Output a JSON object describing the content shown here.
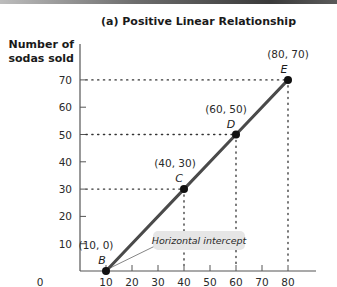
{
  "chart_data": {
    "type": "line",
    "title": "(a) Positive Linear Relationship",
    "xlabel": "",
    "ylabel": "Number of sodas sold",
    "ylabel_lines": [
      "Number of",
      "sodas sold"
    ],
    "x_ticks": [
      0,
      10,
      20,
      30,
      40,
      50,
      60,
      70,
      80
    ],
    "y_ticks": [
      10,
      20,
      30,
      40,
      50,
      60,
      70
    ],
    "xlim": [
      0,
      88
    ],
    "ylim": [
      0,
      75
    ],
    "grid": false,
    "series": [
      {
        "name": "Positive linear relationship",
        "x": [
          10,
          40,
          60,
          80
        ],
        "y": [
          0,
          30,
          50,
          70
        ],
        "color": "#4a4a4a"
      }
    ],
    "points": [
      {
        "letter": "B",
        "label": "(10, 0)",
        "x": 10,
        "y": 0
      },
      {
        "letter": "C",
        "label": "(40, 30)",
        "x": 40,
        "y": 30
      },
      {
        "letter": "D",
        "label": "(60, 50)",
        "x": 60,
        "y": 50
      },
      {
        "letter": "E",
        "label": "(80, 70)",
        "x": 80,
        "y": 70
      }
    ],
    "annotations": [
      {
        "text": "Horizontal intercept",
        "points_to": "B"
      }
    ],
    "guide_lines": "dotted lines from C, D, E to both axes"
  },
  "colors": {
    "line": "#4a4a4a",
    "axis": "#555555",
    "callout_bg": "#e6e6e6"
  }
}
